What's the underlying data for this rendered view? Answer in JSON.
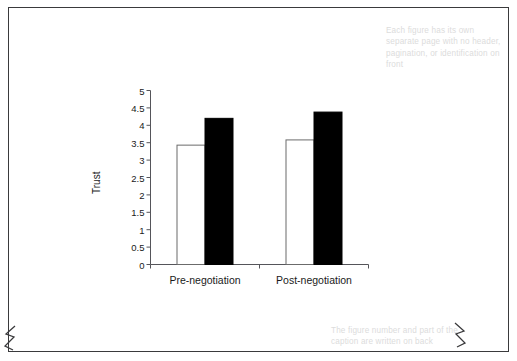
{
  "document": {
    "frame_color": "#3a3a3c",
    "background": "#ffffff"
  },
  "annotations": {
    "top_note": "Each figure has its own separate page with no header, pagination, or identification on front",
    "bottom_note": "The figure number and part of the caption are written on back",
    "note_color": "#dcdcdc"
  },
  "chart_data": {
    "type": "bar",
    "title": "",
    "xlabel": "",
    "ylabel": "Trust",
    "categories": [
      "Pre-negotiation",
      "Post-negotiation"
    ],
    "series": [
      {
        "name": "white-bar",
        "values": [
          3.43,
          3.58
        ],
        "fill": "#ffffff",
        "stroke": "#6b6b6b"
      },
      {
        "name": "black-bar",
        "values": [
          4.2,
          4.38
        ],
        "fill": "#000000",
        "stroke": "#000000"
      }
    ],
    "ylim": [
      0,
      5
    ],
    "yticks": [
      "0",
      "0.5",
      "1",
      "1.5",
      "2",
      "2.5",
      "3",
      "3.5",
      "4",
      "4.5",
      "5"
    ],
    "ytick_values": [
      0,
      0.5,
      1,
      1.5,
      2,
      2.5,
      3,
      3.5,
      4,
      4.5,
      5
    ],
    "grid": false,
    "legend": "none",
    "axis_color": "#55555a"
  }
}
